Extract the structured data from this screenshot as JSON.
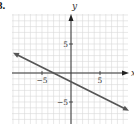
{
  "problem_label": "8.",
  "chart_data": {
    "type": "line",
    "title": "",
    "xlabel": "x",
    "ylabel": "y",
    "xlim": [
      -10,
      10
    ],
    "ylim": [
      -10,
      10
    ],
    "grid": true,
    "x_ticks_labeled": [
      -5,
      5
    ],
    "y_ticks_labeled": [
      5,
      -5
    ],
    "tick_labels": {
      "x": [
        "−5",
        "5"
      ],
      "y": [
        "5",
        "−5"
      ]
    },
    "series": [
      {
        "name": "line",
        "equation": "y = -x/2 - 3/2",
        "x": [
          -10,
          -3,
          0,
          10
        ],
        "y": [
          3.5,
          0,
          -1.5,
          -6.5
        ],
        "arrows_both_ends": true,
        "color": "#555555"
      }
    ],
    "legend": null
  }
}
